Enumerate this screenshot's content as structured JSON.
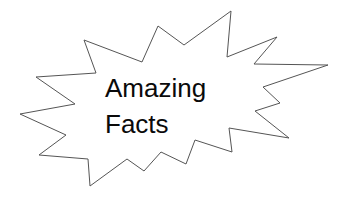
{
  "graphic": {
    "shape": "starburst",
    "stroke_color": "#555555",
    "fill_color": "#ffffff",
    "points": "84,40 96,73 36,77 75,104 20,114 66,135 39,155 88,159 90,186 127,159 144,171 161,152 186,164 195,140 232,152 229,128 289,138 255,111 280,103 263,87 328,65 254,64 277,37 227,57 231,11 184,45 158,26 142,62"
  },
  "text": {
    "line1": "Amazing",
    "line2": "Facts",
    "color": "#0a0a0a"
  }
}
